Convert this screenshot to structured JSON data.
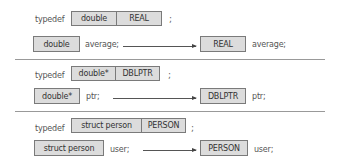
{
  "sections": [
    {
      "typedef_keyword": "typedef",
      "original_type": "double",
      "alias": "REAL",
      "terminator": ";",
      "usage_before": {
        "type": "double",
        "var": "average;"
      },
      "usage_after": {
        "type": "REAL",
        "var": "average;"
      }
    },
    {
      "typedef_keyword": "typedef",
      "original_type": "double*",
      "alias": "DBLPTR",
      "terminator": ";",
      "usage_before": {
        "type": "double*",
        "var": "ptr;"
      },
      "usage_after": {
        "type": "DBLPTR",
        "var": "ptr;"
      }
    },
    {
      "typedef_keyword": "typedef",
      "original_type": "struct person",
      "alias": "PERSON",
      "terminator": ";",
      "usage_before": {
        "type": "struct person",
        "var": "user;"
      },
      "usage_after": {
        "type": "PERSON",
        "var": "user;"
      }
    }
  ],
  "colors": {
    "box_fill": "#dcdcdc",
    "box_border": "#7a7a7a",
    "separator": "#999999"
  }
}
